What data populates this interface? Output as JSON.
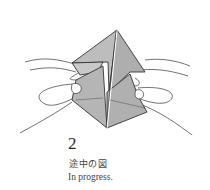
{
  "diagram": {
    "type": "origami-instruction-step",
    "colors": {
      "paper": "#b8b8b8",
      "outline": "#333333",
      "background": "#ffffff"
    }
  },
  "caption": {
    "step_number": "2",
    "japanese": "途中の図",
    "english": "In progress."
  }
}
